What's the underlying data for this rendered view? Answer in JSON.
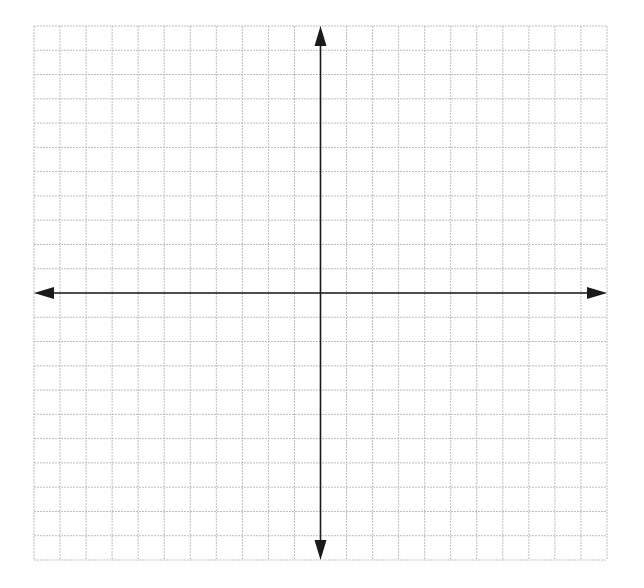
{
  "diagram": {
    "type": "coordinate-plane",
    "grid": {
      "columns": 22,
      "rows": 22,
      "left": 34,
      "top": 26,
      "right": 607,
      "bottom": 560,
      "line_color": "#bdbdbd",
      "background": "#ffffff"
    },
    "axes": {
      "origin_column": 11,
      "origin_row": 11,
      "color": "#1a1a1a",
      "arrows": [
        "up",
        "down",
        "left",
        "right"
      ]
    },
    "labels": []
  }
}
